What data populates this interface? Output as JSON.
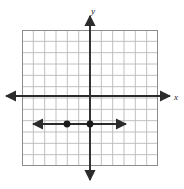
{
  "figure": {
    "type": "coordinate-grid",
    "title": "",
    "background": "#ffffff",
    "grid": {
      "visible": true,
      "columns": 12,
      "rows": 12,
      "cell_size_px": 11.3,
      "line_color": "#b9b9b9",
      "border_color": "#8c8c8c",
      "left_px": 22,
      "top_px": 30,
      "width_px": 136,
      "height_px": 136
    },
    "axes": {
      "color": "#2b2b2b",
      "x_axis": {
        "label": "x",
        "label_x_px": 174,
        "label_y_px": 100,
        "y_px": 96,
        "start_px": 6,
        "end_px": 170,
        "arrow_start": true,
        "arrow_end": true
      },
      "y_axis": {
        "label": "y",
        "label_x_px": 91,
        "label_y_px": 14,
        "x_px": 90,
        "start_px": 16,
        "end_px": 180,
        "arrow_start": true,
        "arrow_end": true
      }
    },
    "line": {
      "description": "horizontal line below the x-axis",
      "equation": "y = -2",
      "color": "#2b2b2b",
      "y_px": 124,
      "start_px": 33,
      "end_px": 126,
      "arrow_start": true,
      "arrow_end": true
    },
    "points": [
      {
        "name": "point-a",
        "x": -2,
        "y": -2,
        "cx_px": 67,
        "cy_px": 124,
        "r_px": 3.4,
        "color": "#1a1a1a"
      },
      {
        "name": "point-b",
        "x": 0,
        "y": -2,
        "cx_px": 90,
        "cy_px": 124,
        "r_px": 3.4,
        "color": "#1a1a1a"
      }
    ]
  }
}
